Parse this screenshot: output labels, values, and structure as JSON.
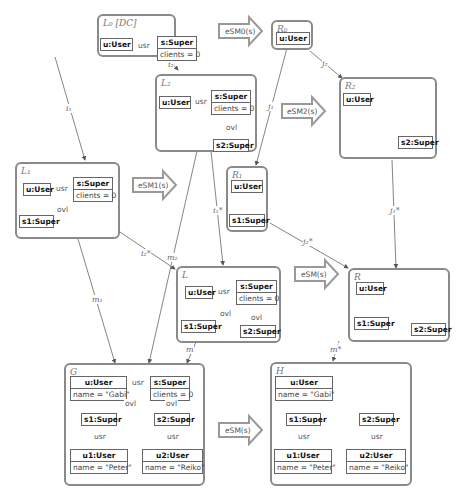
{
  "panels": {
    "L0": {
      "label": "L₀ [DC]"
    },
    "L1": {
      "label": "L₁"
    },
    "L2": {
      "label": "L₂"
    },
    "L": {
      "label": "L"
    },
    "R0": {
      "label": "R₀"
    },
    "R1": {
      "label": "R₁"
    },
    "R2": {
      "label": "R₂"
    },
    "R": {
      "label": "R"
    },
    "G": {
      "label": "G"
    },
    "H": {
      "label": "H"
    }
  },
  "objects": {
    "user": "u:User",
    "super": "s:Super",
    "clients": "clients = 0",
    "s1": "s1:Super",
    "s2": "s2:Super",
    "u1": "u1:User",
    "u2": "u2:User",
    "name_gabi": "name = \"Gabi\"",
    "name_peter": "name = \"Peter\"",
    "name_reiko": "name = \"Reiko\""
  },
  "edges": {
    "usr": "usr",
    "ovl": "ovl"
  },
  "rules": {
    "esm0": "eSM0(s)",
    "esm1": "eSM1(s)",
    "esm2": "eSM2(s)",
    "esm": "eSM(s)",
    "esm_g": "eSM(s)"
  },
  "morphisms": {
    "i1": "i₁",
    "i2": "i₂",
    "j1": "j₁",
    "j2": "j₂",
    "i1s": "i₁*",
    "i2s": "i₂*",
    "j1s": "j₁*",
    "j2s": "j₂*",
    "m1": "m₁",
    "m2": "m₂",
    "m": "m",
    "ms": "m*"
  }
}
